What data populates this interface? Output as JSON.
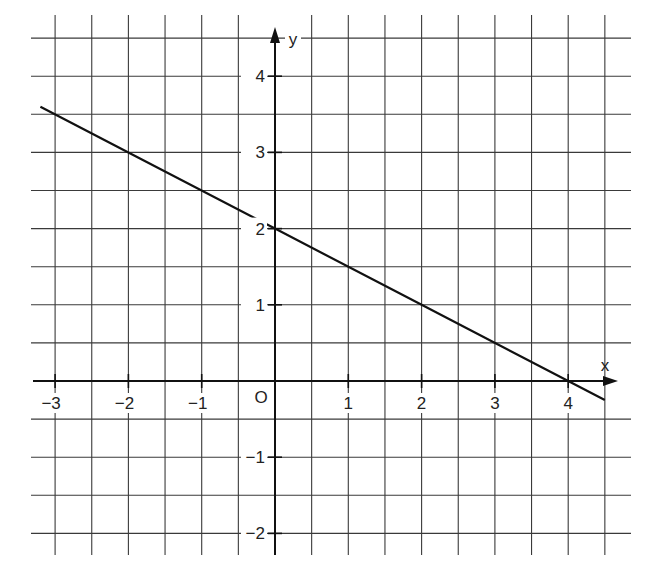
{
  "chart_data": {
    "type": "line",
    "title": "",
    "xlabel": "x",
    "ylabel": "y",
    "origin_label": "O",
    "xlim": [
      -3,
      4.5
    ],
    "ylim": [
      -2,
      4.5
    ],
    "grid": true,
    "grid_step": 0.5,
    "x_ticks": [
      -3,
      -2,
      -1,
      1,
      2,
      3,
      4
    ],
    "x_tick_labels": [
      "−3",
      "−2",
      "−1",
      "1",
      "2",
      "3",
      "4"
    ],
    "y_ticks": [
      4,
      3,
      2,
      1,
      -1,
      -2
    ],
    "y_tick_labels": [
      "4",
      "3",
      "2",
      "1",
      "−1",
      "−2"
    ],
    "series": [
      {
        "name": "y = -0.5x + 2",
        "equation": "y = -1/2 x + 2",
        "x": [
          -3.2,
          -2,
          0,
          2,
          4,
          4.5
        ],
        "y": [
          3.6,
          3,
          2,
          1,
          0,
          -0.25
        ]
      }
    ],
    "key_points": [
      {
        "x": 0,
        "y": 2,
        "label": "y-intercept"
      },
      {
        "x": 4,
        "y": 0,
        "label": "x-intercept"
      }
    ]
  },
  "colors": {
    "background": "#ffffff",
    "grid": "#3a3a3a",
    "axis": "#111111",
    "line": "#111111"
  }
}
